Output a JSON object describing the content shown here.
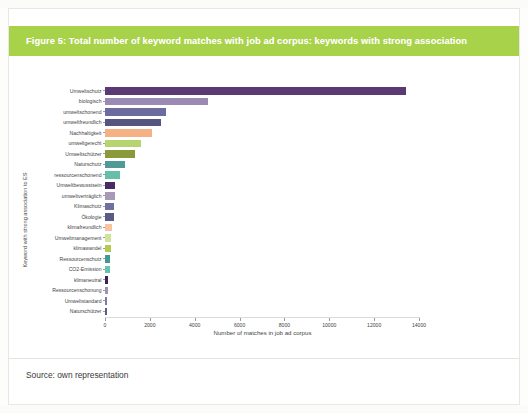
{
  "figure": {
    "title": "Figure 5: Total number of keyword matches with job ad corpus: keywords with strong association",
    "source": "Source: own representation",
    "banner_color": "#a8d24a"
  },
  "chart_data": {
    "type": "bar",
    "orientation": "horizontal",
    "title": "Figure 5: Total number of keyword matches with job ad corpus: keywords with strong association",
    "xlabel": "Number of matches in job ad corpus",
    "ylabel": "Keyword with strong association to ES",
    "xlim": [
      0,
      14000
    ],
    "xticks": [
      0,
      2000,
      4000,
      6000,
      8000,
      10000,
      12000,
      14000
    ],
    "xticklabels": [
      "0",
      "2000",
      "4000",
      "6000",
      "8000",
      "10000",
      "12000",
      "14000"
    ],
    "grid": false,
    "legend": "none",
    "categories": [
      "Umweltschutz",
      "biologisch",
      "umweltschonend",
      "umweltfreundlich",
      "Nachhaltigkeit",
      "umweltgerecht",
      "Umweltschützer",
      "Naturschutz",
      "ressourcenschonend",
      "Umweltbewusstsein",
      "umweltverträglich",
      "Klimaschutz",
      "Ökologie",
      "klimafreundlich",
      "Umweltmanagement",
      "klimawandel",
      "Ressourcenschutz",
      "CO2-Emission",
      "klimaneutral",
      "Ressourcenschonung",
      "Umweltstandard",
      "Naturschützer"
    ],
    "values": [
      13400,
      4600,
      2700,
      2500,
      2100,
      1600,
      1350,
      900,
      650,
      450,
      430,
      400,
      390,
      300,
      280,
      250,
      230,
      210,
      150,
      120,
      100,
      80
    ],
    "colors": [
      "#5b3a74",
      "#9b8bb4",
      "#6c6d9e",
      "#55557f",
      "#f5b183",
      "#b6d470",
      "#8a9a3a",
      "#4f9a96",
      "#66bfa8",
      "#4a2a63",
      "#a79ab9",
      "#6f6fa0",
      "#5a5a89",
      "#f7c3a0",
      "#cfe39a",
      "#b5c94f",
      "#3f9a93",
      "#63c4b0",
      "#3d2257",
      "#a192b5",
      "#7a7aa8",
      "#5c5c8c"
    ]
  }
}
